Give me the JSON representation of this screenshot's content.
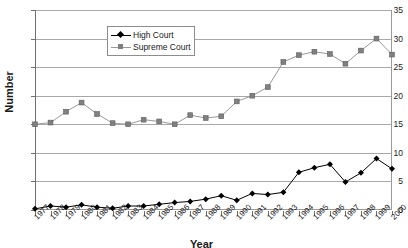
{
  "chart_data": {
    "type": "line",
    "title": "",
    "xlabel": "Year",
    "ylabel": "Number",
    "ylim": [
      0,
      35
    ],
    "ytick_step": 5,
    "yticks": [
      0,
      5,
      10,
      15,
      20,
      25,
      30,
      35
    ],
    "grid": true,
    "legend_position": "upper-left-inside",
    "categories": [
      "1977",
      "1978",
      "1979",
      "1980",
      "1981",
      "1982",
      "1983",
      "1984",
      "1985",
      "1986",
      "1987",
      "1988",
      "1989",
      "1990",
      "1991",
      "1992",
      "1993",
      "1994",
      "1995",
      "1996",
      "1997",
      "1998",
      "1999",
      "2000"
    ],
    "series": [
      {
        "name": "High Court",
        "color": "#000000",
        "marker": "diamond",
        "values": [
          0.2,
          0.7,
          0.5,
          0.9,
          0.5,
          0.3,
          0.7,
          0.7,
          1.0,
          1.3,
          1.5,
          1.9,
          2.5,
          1.7,
          2.9,
          2.7,
          3.1,
          6.6,
          7.4,
          8.0,
          4.9,
          6.5,
          9.0,
          7.2
        ]
      },
      {
        "name": "Supreme Court",
        "color": "#808080",
        "marker": "square",
        "values": [
          15.0,
          15.3,
          17.2,
          18.8,
          16.8,
          15.2,
          15.0,
          15.8,
          15.5,
          15.0,
          16.6,
          16.1,
          16.4,
          19.0,
          20.0,
          21.5,
          25.9,
          27.1,
          27.7,
          27.3,
          25.6,
          27.9,
          30.0,
          27.2
        ]
      }
    ]
  },
  "legend": {
    "items": [
      {
        "label": "High Court"
      },
      {
        "label": "Supreme Court"
      }
    ]
  },
  "axes": {
    "y_title": "Number",
    "x_title": "Year"
  },
  "colors": {
    "high_court": "#000000",
    "supreme_court": "#808080",
    "gridline": "#a8a8a8",
    "axis": "#6f6f6f",
    "background": "#ffffff"
  }
}
